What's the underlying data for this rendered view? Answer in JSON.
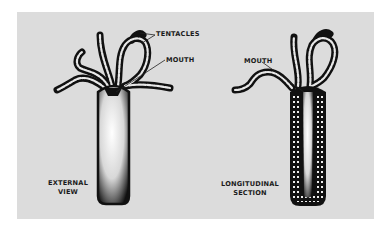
{
  "figure": {
    "background_color": "#dcdcdc",
    "ink_color": "#111111",
    "views": [
      {
        "name": "external-view",
        "caption_lines": [
          "EXTERNAL",
          "VIEW"
        ],
        "labels": [
          {
            "text": "TENTACLES"
          },
          {
            "text": "MOUTH"
          }
        ]
      },
      {
        "name": "longitudinal-section",
        "caption_lines": [
          "LONGITUDINAL",
          "SECTION"
        ],
        "labels": [
          {
            "text": "MOUTH"
          }
        ]
      }
    ]
  }
}
